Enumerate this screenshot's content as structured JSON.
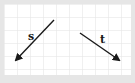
{
  "diagram": {
    "background": "#ffffff",
    "frame_color": "#e6e6e6",
    "grid_color": "#e2e2e2",
    "arrow_color": "#1a1a1a",
    "grid_spacing": 13,
    "vectors": [
      {
        "label": "s",
        "x1": 54,
        "y1": 20,
        "x2": 16,
        "y2": 60,
        "label_x": 31,
        "label_y": 40
      },
      {
        "label": "t",
        "x1": 80,
        "y1": 33,
        "x2": 119,
        "y2": 60,
        "label_x": 102,
        "label_y": 43
      }
    ]
  }
}
